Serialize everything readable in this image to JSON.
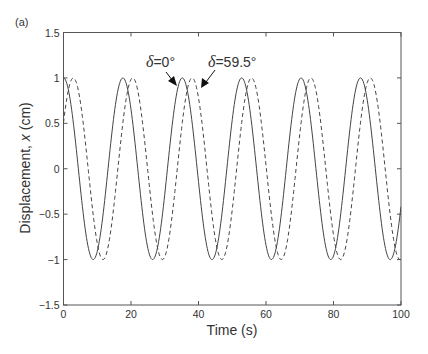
{
  "figure": {
    "panel_label": "(a)"
  },
  "chart_data": {
    "type": "line",
    "title": "",
    "panel_label": "(a)",
    "xlabel": "Time (s)",
    "ylabel": "Displacement, x (cm)",
    "ylabel_parts": {
      "prefix": "Displacement, ",
      "var": "x",
      "suffix": " (cm)"
    },
    "xlim": [
      0,
      100
    ],
    "ylim": [
      -1.5,
      1.5
    ],
    "xticks": [
      0,
      20,
      40,
      60,
      80,
      100
    ],
    "xtick_labels": [
      "0",
      "20",
      "40",
      "60",
      "80",
      "100"
    ],
    "yticks": [
      -1.5,
      -1,
      -0.5,
      0,
      0.5,
      1,
      1.5
    ],
    "ytick_labels": [
      "−1.5",
      "−1",
      "−0.5",
      "0",
      "0.5",
      "1",
      "1.5"
    ],
    "grid": false,
    "legend": null,
    "model": "x(t) = A cos(omega t - delta)",
    "amplitude": 1.0,
    "omega_rad_per_s": 0.357,
    "period_s": 17.6,
    "series": [
      {
        "name": "δ=0°",
        "delta_deg": 0,
        "style": "solid",
        "color": "#444444",
        "x": [
          0,
          4.4,
          8.8,
          13.2,
          17.6,
          22.0,
          26.4,
          30.8,
          35.2,
          39.6,
          44.0,
          48.4,
          52.8,
          57.2,
          61.6,
          66.0,
          70.4,
          74.8,
          79.2,
          83.6,
          88.0,
          92.4,
          96.8,
          100
        ],
        "values": [
          1.0,
          0.0,
          -1.0,
          0.0,
          1.0,
          0.0,
          -1.0,
          0.0,
          1.0,
          0.0,
          -1.0,
          0.0,
          1.0,
          0.0,
          -1.0,
          0.0,
          1.0,
          0.0,
          -1.0,
          0.0,
          1.0,
          0.0,
          -1.0,
          -0.6
        ]
      },
      {
        "name": "δ=59.5°",
        "delta_deg": 59.5,
        "style": "dashed",
        "color": "#444444",
        "x": [
          0,
          2.9,
          7.3,
          11.7,
          16.1,
          20.5,
          24.9,
          29.3,
          33.7,
          38.1,
          42.5,
          46.9,
          51.3,
          55.7,
          60.1,
          64.5,
          68.9,
          73.3,
          77.7,
          82.1,
          86.5,
          90.9,
          95.3,
          100
        ],
        "values": [
          0.51,
          1.0,
          0.0,
          -1.0,
          0.0,
          1.0,
          0.0,
          -1.0,
          0.0,
          1.0,
          0.0,
          -1.0,
          0.0,
          1.0,
          0.0,
          -1.0,
          0.0,
          1.0,
          0.0,
          -1.0,
          0.0,
          1.0,
          0.0,
          -0.9
        ]
      }
    ],
    "annotations": [
      {
        "text": "δ=0°",
        "symbol": "δ",
        "rest": "=0°",
        "points_to_series": "δ=0°",
        "arrow_target": [
          33.5,
          0.9
        ]
      },
      {
        "text": "δ=59.5°",
        "symbol": "δ",
        "rest": "=59.5°",
        "points_to_series": "δ=59.5°",
        "arrow_target": [
          40.5,
          0.88
        ]
      }
    ]
  }
}
